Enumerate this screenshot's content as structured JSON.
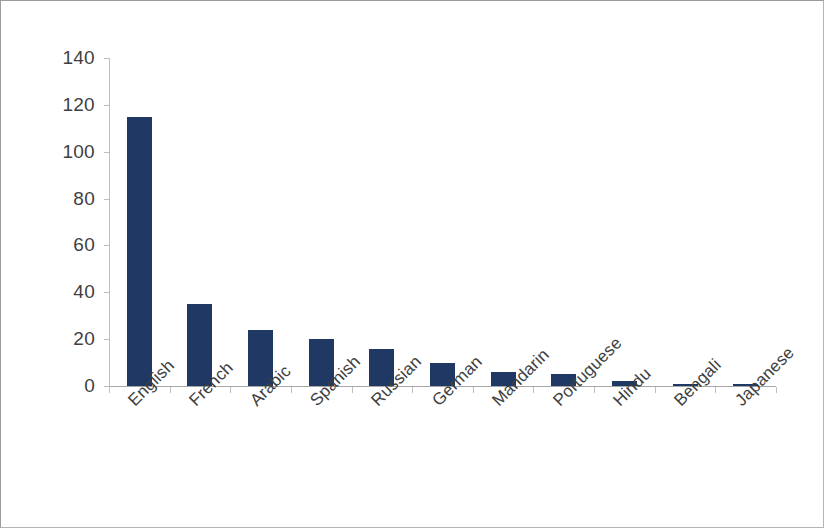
{
  "chart_data": {
    "type": "bar",
    "title": "",
    "subtitle": "",
    "xlabel": "",
    "ylabel": "",
    "legend": [],
    "legend_position": "none",
    "grid": false,
    "ylim": [
      0,
      140
    ],
    "ytick_step": 20,
    "yticks": [
      0,
      20,
      40,
      60,
      80,
      100,
      120,
      140
    ],
    "ytick_labels": [
      "0",
      "20",
      "40",
      "60",
      "80",
      "100",
      "120",
      "140"
    ],
    "categories": [
      "English",
      "French",
      "Arabic",
      "Spanish",
      "Russian",
      "German",
      "Mandarin",
      "Portuguese",
      "Hindu",
      "Bengali",
      "Japanese"
    ],
    "values": [
      115,
      35,
      24,
      20,
      16,
      10,
      6,
      5,
      2,
      1,
      1
    ],
    "bar_color": "#1f3864",
    "axis_color": "#bfbfbf",
    "label_color": "#404040"
  }
}
